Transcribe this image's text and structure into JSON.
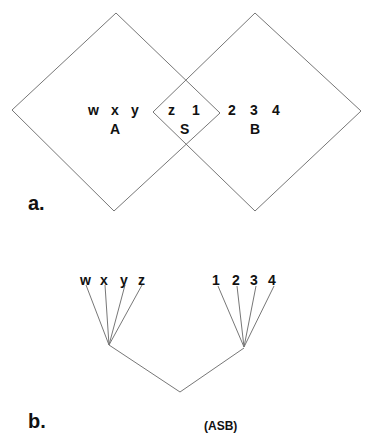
{
  "panel_a": {
    "label": "a.",
    "set_A": {
      "name": "A",
      "elements": [
        "w",
        "x",
        "y"
      ]
    },
    "set_S": {
      "name": "S",
      "elements": [
        "z",
        "1"
      ]
    },
    "set_B": {
      "name": "B",
      "elements": [
        "2",
        "3",
        "4"
      ]
    }
  },
  "panel_b": {
    "label": "b.",
    "left_leaves": [
      "w",
      "x",
      "y",
      "z"
    ],
    "right_leaves": [
      "1",
      "2",
      "3",
      "4"
    ],
    "caption": "(ASB)"
  }
}
